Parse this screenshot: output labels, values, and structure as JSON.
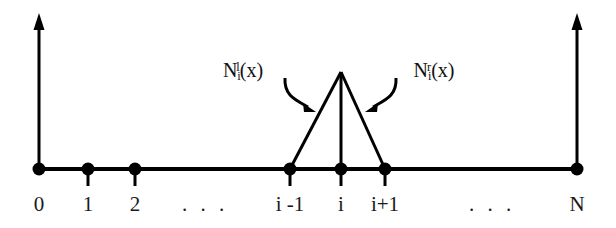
{
  "figure": {
    "name": "linear-hat-basis-function-diagram",
    "background_color": "#ffffff",
    "stroke_color": "#000000",
    "text_color": "#1a1a1a",
    "width": 616,
    "height": 228
  },
  "axis": {
    "baseline_y": 169,
    "left_axis_x": 39,
    "right_axis_x": 577,
    "axis_top_y": 16,
    "name": "number-line-axis"
  },
  "nodes": [
    {
      "label": "0",
      "x": 39,
      "has_tick": false
    },
    {
      "label": "1",
      "x": 88,
      "has_tick": true
    },
    {
      "label": "2",
      "x": 135,
      "has_tick": true
    },
    {
      "label": "i -1",
      "x": 290,
      "has_tick": true
    },
    {
      "label": "i",
      "x": 341,
      "has_tick": true
    },
    {
      "label": "i+1",
      "x": 385,
      "has_tick": true
    },
    {
      "label": "N",
      "x": 577,
      "has_tick": false
    }
  ],
  "ellipses": [
    {
      "label": ". . .",
      "x": 205
    },
    {
      "label": ". . .",
      "x": 492
    }
  ],
  "hat_function": {
    "apex_x": 341,
    "apex_y": 72,
    "left_base_x": 290,
    "right_base_x": 385,
    "name": "hat-function-triangle"
  },
  "annotations": {
    "left": {
      "base": "N",
      "sub": "i",
      "sup": "l",
      "arg": "(x)",
      "x": 243,
      "y": 60,
      "arrow_from_x": 285,
      "arrow_from_y": 78,
      "arrow_to_x": 313,
      "arrow_to_y": 110
    },
    "right": {
      "base": "N",
      "sub": "i",
      "sup": "r",
      "arg": "(x)",
      "x": 434,
      "y": 60,
      "arrow_from_x": 396,
      "arrow_from_y": 78,
      "arrow_to_x": 367,
      "arrow_to_y": 110
    }
  },
  "tick_labels_row_y": 194
}
